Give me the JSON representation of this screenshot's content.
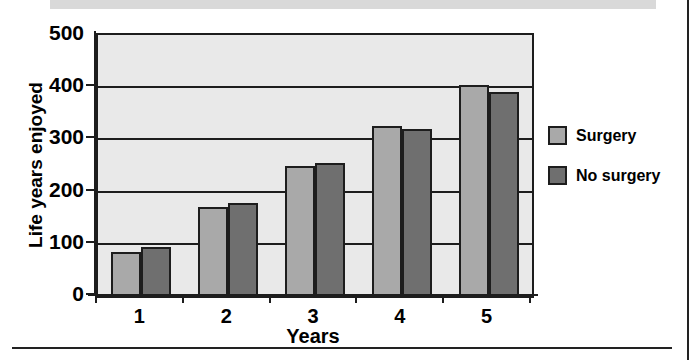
{
  "chart_data": {
    "type": "bar",
    "title": "",
    "xlabel": "Years",
    "ylabel": "Life years enjoyed",
    "categories": [
      "1",
      "2",
      "3",
      "4",
      "5"
    ],
    "series": [
      {
        "name": "Surgery",
        "color": "#a9a9a9",
        "values": [
          84,
          170,
          250,
          326,
          404
        ]
      },
      {
        "name": "No surgery",
        "color": "#6f6f6f",
        "values": [
          94,
          178,
          254,
          319,
          390
        ]
      }
    ],
    "ylim": [
      0,
      500
    ],
    "yticks": [
      "0",
      "100",
      "200",
      "300",
      "400",
      "500"
    ],
    "ytick_values": [
      0,
      100,
      200,
      300,
      400,
      500
    ],
    "grid": true,
    "legend_position": "right",
    "plot_background": "#e9e9e9",
    "axis_color": "#1d1d1d"
  },
  "legend": {
    "items": [
      {
        "label": "Surgery",
        "swatch": "#a9a9a9"
      },
      {
        "label": "No surgery",
        "swatch": "#6f6f6f"
      }
    ]
  }
}
